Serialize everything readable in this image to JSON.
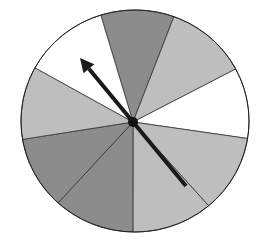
{
  "spinner": {
    "center": [
      133,
      122
    ],
    "rim_points": [
      [
        102,
        16
      ],
      [
        172,
        19
      ],
      [
        233,
        69
      ],
      [
        248,
        139
      ],
      [
        206,
        205
      ],
      [
        133,
        232
      ],
      [
        60,
        203
      ],
      [
        22,
        140
      ],
      [
        38,
        68
      ]
    ],
    "sector_colors": [
      "#8c8c8c",
      "#bebebe",
      "#ffffff",
      "#bebebe",
      "#bebebe",
      "#8c8c8c",
      "#8c8c8c",
      "#bebebe",
      "#ffffff"
    ],
    "sector_count": 9,
    "arrow": {
      "tip": [
        80,
        58
      ],
      "tail": [
        186,
        186
      ],
      "color": "#1a1a1a"
    }
  }
}
